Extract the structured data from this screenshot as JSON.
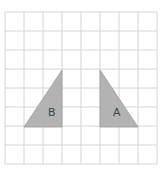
{
  "grid": {
    "cols": 8,
    "rows": 8,
    "cell": 19,
    "origin_x": 5,
    "origin_y": 12,
    "line_color": "#d4d4d4"
  },
  "shapes": [
    {
      "id": "B",
      "label": "B",
      "points": "24,127 62,70 62,127",
      "label_x": 48,
      "label_y": 116,
      "fill": "#b3b3b3",
      "stroke": "#9a9a9a"
    },
    {
      "id": "A",
      "label": "A",
      "points": "100,70 100,127 138,127",
      "label_x": 113,
      "label_y": 116,
      "fill": "#b3b3b3",
      "stroke": "#9a9a9a"
    }
  ]
}
